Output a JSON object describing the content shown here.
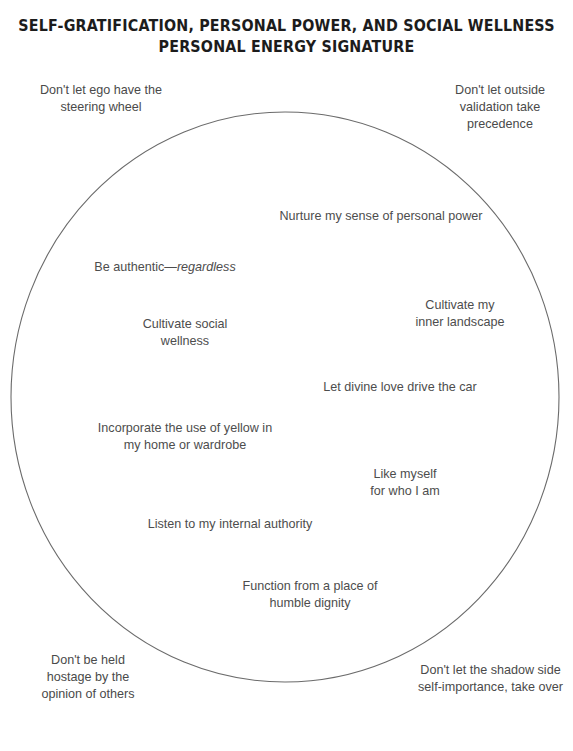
{
  "title": {
    "line1": "SELF-GRATIFICATION, PERSONAL POWER, AND SOCIAL WELLNESS",
    "line2": "PERSONAL ENERGY SIGNATURE"
  },
  "diagram": {
    "shape": "ellipse",
    "stroke_color": "#6b6b6b",
    "fill_color": "#ffffff",
    "background_color": "#ffffff",
    "text_color": "#4a4a4a",
    "title_color": "#1c1c1c"
  },
  "inside_items": [
    {
      "id": "nurture",
      "text": "Nurture my sense of personal power"
    },
    {
      "id": "authentic",
      "text_before": "Be authentic—",
      "text_italic": "regardless"
    },
    {
      "id": "cultivate-social",
      "text": "Cultivate social\nwellness"
    },
    {
      "id": "inner-landscape",
      "text": "Cultivate my\ninner landscape"
    },
    {
      "id": "divine-love",
      "text": "Let divine love drive the car"
    },
    {
      "id": "yellow",
      "text": "Incorporate the use of yellow in\nmy home or wardrobe"
    },
    {
      "id": "like-myself",
      "text": "Like myself\nfor who I am"
    },
    {
      "id": "listen",
      "text": "Listen to my internal authority"
    },
    {
      "id": "function",
      "text": "Function from a place of\nhumble dignity"
    }
  ],
  "outside_items": [
    {
      "id": "ego",
      "position": "top-left",
      "text": "Don't let ego have the\nsteering wheel"
    },
    {
      "id": "validation",
      "position": "top-right",
      "text": "Don't let outside\nvalidation take\nprecedence"
    },
    {
      "id": "hostage",
      "position": "bottom-left",
      "text": "Don't be held\nhostage by the\nopinion of others"
    },
    {
      "id": "shadow",
      "position": "bottom-right",
      "text": "Don't let the shadow side\nself-importance, take over"
    }
  ]
}
